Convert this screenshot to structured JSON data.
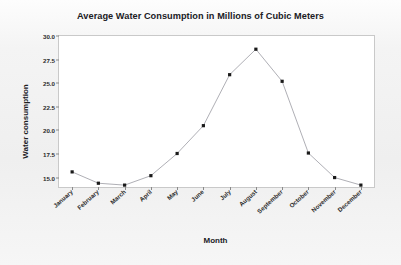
{
  "chart_data": {
    "type": "line",
    "title": "Average Water Consumption in Millions of Cubic Meters",
    "xlabel": "Month",
    "ylabel": "Water consumption",
    "categories": [
      "January",
      "February",
      "March",
      "April",
      "May",
      "June",
      "July",
      "August",
      "September",
      "October",
      "November",
      "December"
    ],
    "values": [
      15.6,
      14.4,
      14.2,
      15.2,
      17.55,
      20.5,
      25.9,
      28.6,
      25.2,
      17.6,
      15.0,
      14.2
    ],
    "ylim": [
      14.0,
      30.0
    ],
    "yticks": [
      "30.0",
      "27.5",
      "25.0",
      "22.5",
      "20.0",
      "17.5",
      "15.0"
    ],
    "ytick_values": [
      30.0,
      27.5,
      25.0,
      22.5,
      20.0,
      17.5,
      15.0
    ],
    "grid": false,
    "legend": "none",
    "marker": "square",
    "marker_color": "#1a1a1a",
    "line_color": "#9a9aa2"
  }
}
